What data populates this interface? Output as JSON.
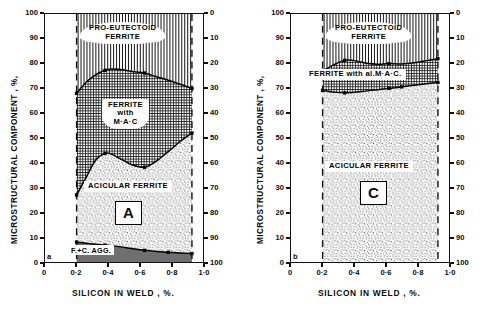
{
  "figure": {
    "title": "",
    "panels": [
      {
        "id": "a",
        "panel_letter": "a",
        "big_letter": "A",
        "axes": {
          "ylabel": "MICROSTRUCTURAL  COMPONENT , %,",
          "xlabel": "SILICON  IN  WELD , %.",
          "yticks_left": [
            "0",
            "10",
            "20",
            "30",
            "40",
            "50",
            "60",
            "70",
            "80",
            "90",
            "100"
          ],
          "yticks_right": [
            "0",
            "10",
            "20",
            "30",
            "40",
            "50",
            "60",
            "70",
            "80",
            "90",
            "100"
          ],
          "xticks": [
            "0",
            "0·2",
            "0·4",
            "0·6",
            "0·8",
            "1·0"
          ],
          "ylim": [
            0,
            100
          ],
          "xlim": [
            0,
            1.0
          ],
          "right_axis_inverted": true,
          "grid": false
        },
        "region_labels": [
          {
            "name": "pro-eutectoid-ferrite",
            "text": "PRO-EUTECTOID\nFERRITE",
            "texture": "vertical-lines"
          },
          {
            "name": "ferrite-with-mac",
            "text": "FERRITE\nwith\nM·A·C",
            "texture": "cross-grid"
          },
          {
            "name": "acicular-ferrite",
            "text": "ACICULAR FERRITE",
            "texture": "stipple"
          },
          {
            "name": "f-c-agg",
            "text": "F.+C. AGG.",
            "texture": "solid-gray"
          }
        ]
      },
      {
        "id": "c",
        "panel_letter": "b",
        "big_letter": "C",
        "axes": {
          "ylabel": "MICROSTRUCTURAL  COMPONENT , %,",
          "xlabel": "SILICON  IN  WELD , %.",
          "yticks_left": [
            "0",
            "10",
            "20",
            "30",
            "40",
            "50",
            "60",
            "70",
            "80",
            "90",
            "100"
          ],
          "yticks_right": [
            "0",
            "10",
            "20",
            "30",
            "40",
            "50",
            "60",
            "70",
            "80",
            "90",
            "100"
          ],
          "xticks": [
            "0",
            "0·2",
            "0·4",
            "0·6",
            "0·8",
            "1·0"
          ],
          "ylim": [
            0,
            100
          ],
          "xlim": [
            0,
            1.0
          ],
          "right_axis_inverted": true,
          "grid": false
        },
        "region_labels": [
          {
            "name": "pro-eutectoid-ferrite",
            "text": "PRO-EUTECTOID\nFERRITE",
            "texture": "vertical-lines"
          },
          {
            "name": "ferrite-with-al-mac",
            "text": "FERRITE with  al.M·A·C.",
            "texture": "cross-grid"
          },
          {
            "name": "acicular-ferrite",
            "text": "ACICULAR FERRITE",
            "texture": "stipple"
          }
        ]
      }
    ]
  },
  "chart_data": [
    {
      "type": "area",
      "panel": "a",
      "title": "Microstructural component vs silicon in weld - A",
      "xlabel": "SILICON IN WELD, %.",
      "ylabel": "MICROSTRUCTURAL COMPONENT, %,",
      "xlim": [
        0,
        1.0
      ],
      "ylim": [
        0,
        100
      ],
      "grid": false,
      "legend": "in-plot region labels",
      "x": [
        0.2,
        0.26,
        0.32,
        0.38,
        0.42,
        0.48,
        0.55,
        0.63,
        0.7,
        0.78,
        0.86,
        0.93
      ],
      "series": [
        {
          "name": "boundary: pro-eutectoid ferrite / ferrite with M-A-C (upper)",
          "values": [
            68.0,
            72.5,
            75.5,
            77.3,
            77.8,
            77.6,
            76.8,
            76.2,
            74.8,
            73.3,
            71.6,
            70.0
          ],
          "markers_x": [
            0.2,
            0.38,
            0.63,
            0.93
          ],
          "markers_y": [
            68.0,
            77.3,
            76.2,
            70.0
          ]
        },
        {
          "name": "boundary: ferrite with M-A-C / acicular ferrite (lower)",
          "values": [
            27.0,
            34.0,
            41.0,
            43.8,
            43.5,
            41.5,
            39.2,
            38.2,
            40.5,
            44.5,
            48.8,
            52.0
          ],
          "markers_x": [
            0.2,
            0.38,
            0.63,
            0.93
          ],
          "markers_y": [
            27.0,
            43.8,
            38.2,
            52.0
          ]
        },
        {
          "name": "boundary: acicular ferrite / F.+C. AGG. (basal)",
          "values": [
            8.0,
            7.6,
            7.2,
            6.8,
            6.6,
            6.1,
            5.4,
            4.7,
            4.3,
            3.9,
            3.6,
            3.4
          ],
          "markers_x": [
            0.2,
            0.38,
            0.63,
            0.78,
            0.93
          ],
          "markers_y": [
            8.0,
            6.8,
            4.7,
            3.9,
            3.4
          ]
        }
      ],
      "regions": [
        {
          "name": "PRO-EUTECTOID FERRITE",
          "spans": "upper boundary to 100%"
        },
        {
          "name": "FERRITE with M-A-C",
          "spans": "lower boundary to upper boundary"
        },
        {
          "name": "ACICULAR FERRITE",
          "spans": "basal boundary to lower boundary"
        },
        {
          "name": "F.+C. AGG.",
          "spans": "0% to basal boundary"
        }
      ],
      "data_x_range": [
        0.2,
        0.93
      ]
    },
    {
      "type": "area",
      "panel": "c",
      "title": "Microstructural component vs silicon in weld - C",
      "xlabel": "SILICON IN WELD, %.",
      "ylabel": "MICROSTRUCTURAL COMPONENT, %,",
      "xlim": [
        0,
        1.0
      ],
      "ylim": [
        0,
        100
      ],
      "grid": false,
      "legend": "in-plot region labels",
      "x": [
        0.2,
        0.27,
        0.34,
        0.4,
        0.47,
        0.55,
        0.62,
        0.7,
        0.78,
        0.86,
        0.93
      ],
      "series": [
        {
          "name": "boundary: pro-eutectoid ferrite / ferrite with al.M-A-C (upper)",
          "values": [
            77.0,
            79.5,
            81.3,
            81.2,
            80.2,
            79.7,
            80.0,
            79.8,
            80.3,
            81.2,
            82.0
          ],
          "markers_x": [
            0.2,
            0.34,
            0.62,
            0.93
          ],
          "markers_y": [
            77.0,
            81.3,
            80.0,
            82.0
          ]
        },
        {
          "name": "boundary: ferrite with al.M-A-C / acicular ferrite (lower)",
          "values": [
            69.2,
            68.5,
            68.2,
            68.4,
            68.9,
            69.5,
            70.0,
            70.6,
            71.3,
            71.9,
            72.4
          ],
          "markers_x": [
            0.2,
            0.34,
            0.62,
            0.7,
            0.93
          ],
          "markers_y": [
            69.2,
            68.2,
            70.0,
            70.6,
            72.4
          ]
        }
      ],
      "regions": [
        {
          "name": "PRO-EUTECTOID FERRITE",
          "spans": "upper boundary to 100%"
        },
        {
          "name": "FERRITE with al.M-A-C.",
          "spans": "lower boundary to upper boundary"
        },
        {
          "name": "ACICULAR FERRITE",
          "spans": "0% to lower boundary"
        }
      ],
      "data_x_range": [
        0.2,
        0.93
      ]
    }
  ]
}
